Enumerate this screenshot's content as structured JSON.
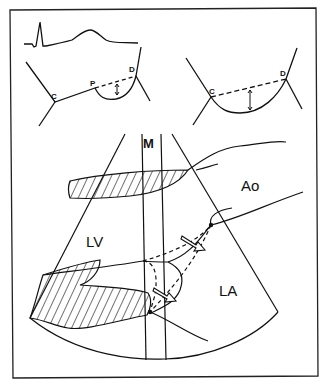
{
  "figure": {
    "type": "echocardiography schematic",
    "panels": {
      "top_left": {
        "description": "ECG trace above M-mode mitral valve motion with C, P, D points",
        "labels": {
          "c": "C",
          "p": "P",
          "d": "D"
        }
      },
      "top_right": {
        "description": "M-mode mitral valve motion C to D with dashed line and double-headed arrow",
        "labels": {
          "c": "C",
          "d": "D"
        }
      },
      "bottom": {
        "description": "2D sector scan with M-mode beam through left ventricle, aorta and left atrium",
        "labels": {
          "m_beam": "M",
          "lv": "LV",
          "ao": "Ao",
          "la": "LA"
        }
      }
    },
    "colors": {
      "ink": "#111111",
      "background": "#ffffff"
    }
  }
}
